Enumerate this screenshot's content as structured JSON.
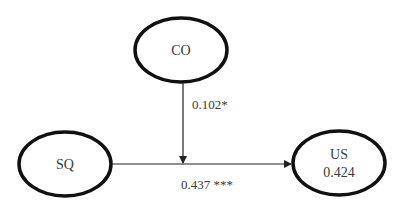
{
  "diagram": {
    "type": "path-model",
    "nodes": {
      "co": {
        "label": "CO",
        "value": null
      },
      "sq": {
        "label": "SQ",
        "value": null
      },
      "us": {
        "label": "US",
        "value": "0.424"
      }
    },
    "edges": {
      "co_to_path": {
        "from": "CO",
        "to": "SQ→US path",
        "label": "0.102*",
        "type": "moderation"
      },
      "sq_to_us": {
        "from": "SQ",
        "to": "US",
        "label": "0.437 ***",
        "type": "direct"
      }
    },
    "colors": {
      "stroke": "#111111",
      "text": "#3a3a3a",
      "background": "#ffffff"
    }
  }
}
